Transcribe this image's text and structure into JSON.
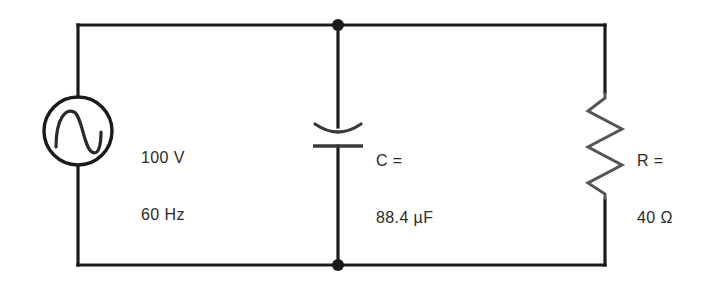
{
  "figure": {
    "background_color": "#ffffff",
    "wire_color": "#1b1b1b"
  },
  "source": {
    "name": "ac-voltage-source",
    "symbol": "sine-wave-in-circle",
    "voltage": "100 V",
    "frequency": "60 Hz"
  },
  "capacitor": {
    "name": "capacitor",
    "symbol": "curved-plate-capacitor",
    "designator_line": "C =",
    "value_line": "88.4 µF"
  },
  "resistor": {
    "name": "resistor",
    "symbol": "zigzag-resistor",
    "designator_line": "R =",
    "value_line": "40 Ω"
  },
  "nodes": {
    "top_junction_label": "top-node",
    "bottom_junction_label": "bottom-node"
  }
}
